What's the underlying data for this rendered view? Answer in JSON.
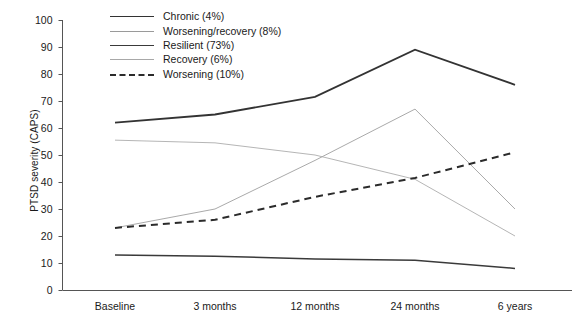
{
  "chart_data": {
    "type": "line",
    "title": "",
    "xlabel": "",
    "ylabel": "PTSD severity (CAPS)",
    "categories": [
      "Baseline",
      "3 months",
      "12 months",
      "24 months",
      "6 years"
    ],
    "ylim": [
      0,
      100
    ],
    "yticks": [
      0,
      10,
      20,
      30,
      40,
      50,
      60,
      70,
      80,
      90,
      100
    ],
    "grid": false,
    "legend_position": "top-center",
    "series": [
      {
        "name": "Chronic (4%)",
        "label": "Chronic (4%)",
        "percent": "4%",
        "style": "solid",
        "width": 1.9,
        "color": "#333333",
        "values": [
          62,
          65,
          71.5,
          89,
          76
        ]
      },
      {
        "name": "Worsening/recovery (8%)",
        "label": "Worsening/recovery (8%)",
        "percent": "8%",
        "style": "solid",
        "width": 0.85,
        "color": "#9a9a9a",
        "values": [
          23,
          30,
          48,
          67,
          30
        ]
      },
      {
        "name": "Resilient (73%)",
        "label": "Resilient (73%)",
        "percent": "73%",
        "style": "solid",
        "width": 1.5,
        "color": "#3a3a3a",
        "values": [
          13,
          12.5,
          11.5,
          11,
          8
        ]
      },
      {
        "name": "Recovery (6%)",
        "label": "Recovery (6%)",
        "percent": "6%",
        "style": "solid",
        "width": 0.85,
        "color": "#a8a8a8",
        "values": [
          55.5,
          54.5,
          50,
          41,
          20
        ]
      },
      {
        "name": "Worsening (10%)",
        "label": "Worsening (10%)",
        "percent": "10%",
        "style": "dashed",
        "width": 2.0,
        "color": "#2b2b2b",
        "values": [
          23,
          26,
          34.5,
          41.5,
          51
        ]
      }
    ]
  },
  "axis": {
    "y_title": "PTSD severity (CAPS)",
    "y_tick_labels": [
      "100",
      "90",
      "80",
      "70",
      "60",
      "50",
      "40",
      "30",
      "20",
      "10",
      "0"
    ],
    "x_tick_labels": [
      "Baseline",
      "3 months",
      "12 months",
      "24 months",
      "6 years"
    ]
  },
  "legend": {
    "entries": [
      {
        "label": "Chronic (4%)"
      },
      {
        "label": "Worsening/recovery (8%)"
      },
      {
        "label": "Resilient (73%)"
      },
      {
        "label": "Recovery (6%)"
      },
      {
        "label": "Worsening (10%)"
      }
    ]
  }
}
